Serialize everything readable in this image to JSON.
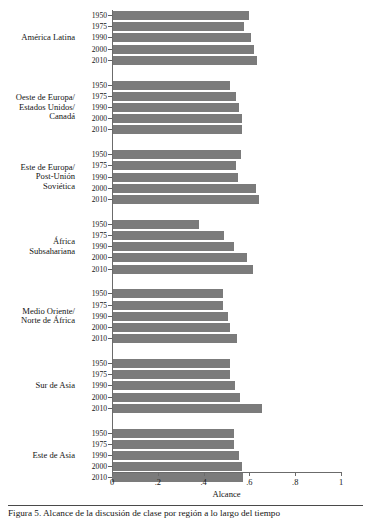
{
  "chart_data": {
    "type": "bar",
    "orientation": "horizontal",
    "title": "",
    "xlabel": "Alcance",
    "ylabel": "",
    "xlim": [
      0,
      1
    ],
    "xticks": [
      0,
      0.2,
      0.4,
      0.6,
      0.8,
      1
    ],
    "xtick_labels": [
      "0",
      ".2",
      ".4",
      ".6",
      ".8",
      "1"
    ],
    "grid": false,
    "legend": null,
    "bar_color": "#7b7b7b",
    "categories": [
      "1950",
      "1975",
      "1990",
      "2000",
      "2010"
    ],
    "groups": [
      {
        "label_lines": [
          "América Latina"
        ],
        "values": [
          0.598,
          0.577,
          0.606,
          0.62,
          0.633
        ]
      },
      {
        "label_lines": [
          "Oeste de Europa/",
          "Estados Unidos/",
          "Canadá"
        ],
        "values": [
          0.515,
          0.54,
          0.555,
          0.568,
          0.568
        ]
      },
      {
        "label_lines": [
          "Este de Europa/",
          "Post-Unión",
          "Soviética"
        ],
        "values": [
          0.563,
          0.541,
          0.551,
          0.628,
          0.643
        ]
      },
      {
        "label_lines": [
          "África",
          "Subsahariana"
        ],
        "values": [
          0.38,
          0.488,
          0.533,
          0.588,
          0.616
        ]
      },
      {
        "label_lines": [
          "Medio Oriente/",
          "Norte de África"
        ],
        "values": [
          0.486,
          0.483,
          0.508,
          0.515,
          0.546
        ]
      },
      {
        "label_lines": [
          "Sur de Asia"
        ],
        "values": [
          0.515,
          0.515,
          0.537,
          0.559,
          0.654
        ]
      },
      {
        "label_lines": [
          "Este de Asia"
        ],
        "values": [
          0.533,
          0.534,
          0.555,
          0.568,
          0.572
        ]
      }
    ]
  },
  "caption": {
    "text": "Figura 5. Alcance de la discusión de clase por región a lo largo del tiempo"
  }
}
